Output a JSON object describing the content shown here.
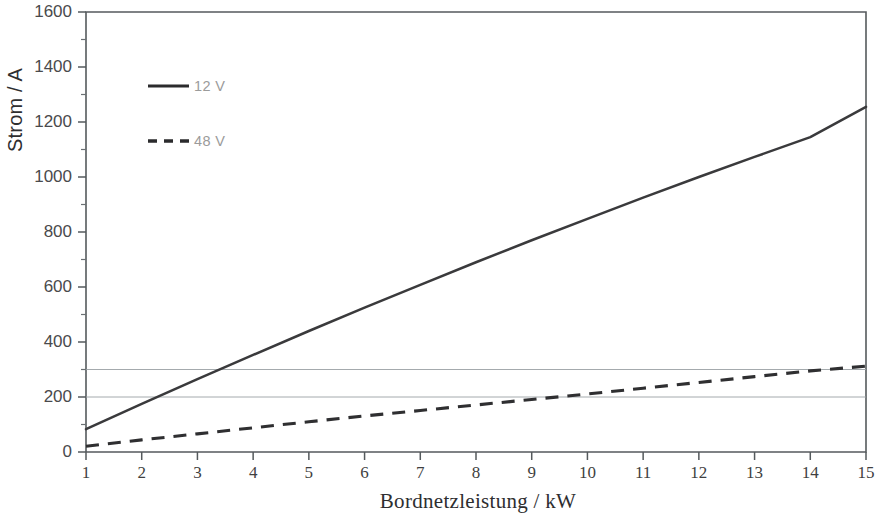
{
  "chart_data": {
    "type": "line",
    "title": "",
    "xlabel": "Bordnetzleistung / kW",
    "ylabel": "Strom / A",
    "xlim": [
      1,
      15
    ],
    "ylim": [
      0,
      1600
    ],
    "x_ticks": [
      1,
      2,
      3,
      4,
      5,
      6,
      7,
      8,
      9,
      10,
      11,
      12,
      13,
      14,
      15
    ],
    "y_ticks": [
      0,
      200,
      400,
      600,
      800,
      1000,
      1200,
      1400,
      1600
    ],
    "y_minor_ticks": [
      100,
      300,
      500,
      700,
      900,
      1100,
      1300,
      1500
    ],
    "grid": false,
    "reference_lines_y": [
      200,
      300
    ],
    "legend_position": "upper-left-inside",
    "x": [
      1,
      2,
      3,
      4,
      5,
      6,
      7,
      8,
      9,
      10,
      11,
      12,
      13,
      14,
      15
    ],
    "series": [
      {
        "name": "12 V",
        "style": "solid",
        "color": "#3a3a3c",
        "values": [
          83,
          175,
          265,
          353,
          440,
          525,
          608,
          690,
          770,
          848,
          925,
          1000,
          1073,
          1145,
          1255
        ]
      },
      {
        "name": "48 V",
        "style": "dashed",
        "color": "#2f2f31",
        "values": [
          21,
          44,
          66,
          88,
          110,
          131,
          151,
          171,
          191,
          211,
          232,
          253,
          274,
          295,
          312
        ]
      }
    ]
  },
  "legend": {
    "items": [
      {
        "label": "12 V",
        "style": "solid"
      },
      {
        "label": "48 V",
        "style": "dashed"
      }
    ]
  },
  "axes": {
    "y_title": "Strom / A",
    "x_title": "Bordnetzleistung / kW"
  }
}
